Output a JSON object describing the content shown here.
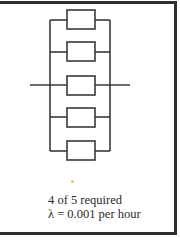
{
  "diagram": {
    "type": "reliability-block-diagram",
    "configuration": "parallel",
    "blocks": [
      {
        "id": 1,
        "label": ""
      },
      {
        "id": 2,
        "label": ""
      },
      {
        "id": 3,
        "label": ""
      },
      {
        "id": 4,
        "label": ""
      },
      {
        "id": 5,
        "label": ""
      }
    ],
    "colors": {
      "line": "#3a3a3a",
      "frame": "#2e2e2e",
      "text": "#2a2a2a"
    }
  },
  "caption": {
    "requirement": "4 of 5 required",
    "failure_rate": "λ = 0.001 per hour"
  }
}
